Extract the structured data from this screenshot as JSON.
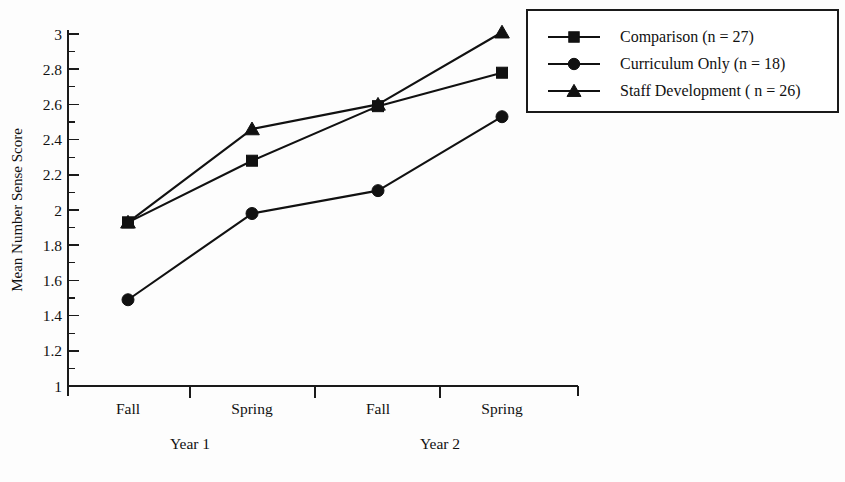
{
  "chart_data": {
    "type": "line",
    "title": "",
    "xlabel": "",
    "ylabel": "Mean Number Sense Score",
    "categories": [
      "Fall",
      "Spring",
      "Fall",
      "Spring"
    ],
    "group_labels": [
      "Year 1",
      "Year 2"
    ],
    "ylim": [
      1,
      3
    ],
    "ytick_step": 0.2,
    "yminor_step": 0.1,
    "ytick_labels": [
      "3",
      "2.8",
      "2.6",
      "2.4",
      "2.2",
      "2",
      "1.8",
      "1.6",
      "1.4",
      "1.2",
      "1"
    ],
    "ytick_values": [
      3,
      2.8,
      2.6,
      2.4,
      2.2,
      2,
      1.8,
      1.6,
      1.4,
      1.2,
      1
    ],
    "grid": false,
    "legend_position": "top-right",
    "series": [
      {
        "name": "Comparison (n = 27)",
        "short_name": "Comparison",
        "n": 27,
        "marker": "square",
        "values": [
          1.93,
          2.28,
          2.59,
          2.78
        ]
      },
      {
        "name": "Curriculum Only (n = 18)",
        "short_name": "Curriculum Only",
        "n": 18,
        "marker": "circle",
        "values": [
          1.49,
          1.98,
          2.11,
          2.53
        ]
      },
      {
        "name": "Staff Development ( n = 26)",
        "short_name": "Staff Development",
        "n": 26,
        "marker": "triangle",
        "values": [
          1.93,
          2.46,
          2.6,
          3.01
        ]
      }
    ]
  },
  "legend": {
    "items": [
      {
        "label": "Comparison (n = 27)",
        "marker": "square"
      },
      {
        "label": "Curriculum Only (n = 18)",
        "marker": "circle"
      },
      {
        "label": "Staff Development ( n = 26)",
        "marker": "triangle"
      }
    ]
  },
  "colors": {
    "ink": "#111111",
    "background": "#fdfdfd",
    "axis": "#1a1a1a"
  }
}
